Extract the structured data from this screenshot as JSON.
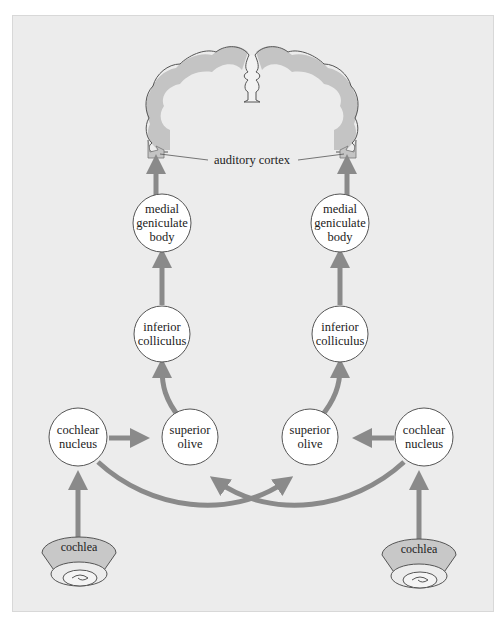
{
  "diagram": {
    "colors": {
      "background": "#ececec",
      "arrow": "#8a8a8a",
      "arrow_edge": "#6e6e6e",
      "node_fill": "#ffffff",
      "node_stroke": "#555555",
      "brain_fill": "#ececec",
      "brain_outline": "#555555",
      "brain_cortex_band": "#c2c2c2",
      "cochlea_fill": "#c8c8c8"
    },
    "labels": {
      "auditory_cortex": "auditory cortex"
    },
    "left": {
      "mgb": [
        "medial",
        "geniculate",
        "body"
      ],
      "ic": [
        "inferior",
        "colliculus"
      ],
      "so": [
        "superior",
        "olive"
      ],
      "cn": [
        "cochlear",
        "nucleus"
      ],
      "cochlea": "cochlea"
    },
    "right": {
      "mgb": [
        "medial",
        "geniculate",
        "body"
      ],
      "ic": [
        "inferior",
        "colliculus"
      ],
      "so": [
        "superior",
        "olive"
      ],
      "cn": [
        "cochlear",
        "nucleus"
      ],
      "cochlea": "cochlea"
    },
    "connections": [
      {
        "from": "left cochlea",
        "to": "left cochlear nucleus"
      },
      {
        "from": "right cochlea",
        "to": "right cochlear nucleus"
      },
      {
        "from": "left cochlear nucleus",
        "to": "left superior olive"
      },
      {
        "from": "right cochlear nucleus",
        "to": "right superior olive"
      },
      {
        "from": "left cochlear nucleus",
        "to": "right superior olive"
      },
      {
        "from": "right cochlear nucleus",
        "to": "left superior olive"
      },
      {
        "from": "left superior olive",
        "to": "left inferior colliculus"
      },
      {
        "from": "right superior olive",
        "to": "right inferior colliculus"
      },
      {
        "from": "left inferior colliculus",
        "to": "left medial geniculate body"
      },
      {
        "from": "right inferior colliculus",
        "to": "right medial geniculate body"
      },
      {
        "from": "left medial geniculate body",
        "to": "auditory cortex (left)"
      },
      {
        "from": "right medial geniculate body",
        "to": "auditory cortex (right)"
      }
    ]
  }
}
